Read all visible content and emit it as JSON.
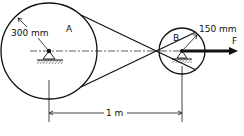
{
  "diagram": {
    "pulley_a": {
      "label": "A",
      "radius_label": "300 mm"
    },
    "pulley_b": {
      "label": "B",
      "radius_label": "150 mm"
    },
    "force": {
      "label": "F"
    },
    "center_distance": {
      "label": "1 m"
    }
  },
  "colors": {
    "stroke": "#111111",
    "background": "#ffffff"
  }
}
